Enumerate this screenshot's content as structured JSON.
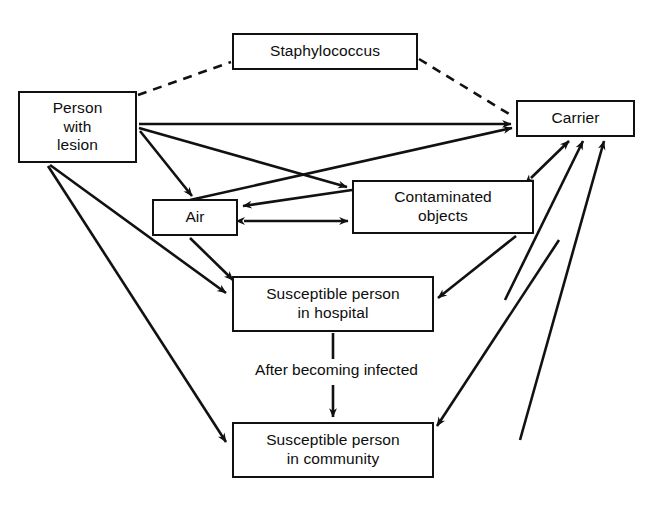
{
  "diagram": {
    "type": "flow-diagram",
    "background_color": "#ffffff",
    "line_color": "#111111",
    "text_color": "#0d0d0d",
    "nodes": [
      {
        "id": "staphylococcus",
        "label": "Staphylococcus"
      },
      {
        "id": "person_with_lesion",
        "label": "Person\nwith\nlesion"
      },
      {
        "id": "carrier",
        "label": "Carrier"
      },
      {
        "id": "air",
        "label": "Air"
      },
      {
        "id": "contaminated_objects",
        "label": "Contaminated\nobjects"
      },
      {
        "id": "susceptible_hospital",
        "label": "Susceptible person\nin hospital"
      },
      {
        "id": "susceptible_community",
        "label": "Susceptible person\nin community"
      }
    ],
    "edge_labels": [
      {
        "id": "after_becoming_infected",
        "text": "After becoming infected"
      }
    ],
    "edges": [
      {
        "from": "person_with_lesion",
        "to": "staphylococcus",
        "style": "dashed",
        "arrow": "none"
      },
      {
        "from": "staphylococcus",
        "to": "carrier",
        "style": "dashed",
        "arrow": "none"
      },
      {
        "from": "person_with_lesion",
        "to": "carrier",
        "style": "solid",
        "arrow": "to"
      },
      {
        "from": "person_with_lesion",
        "to": "contaminated_objects",
        "style": "solid",
        "arrow": "to"
      },
      {
        "from": "person_with_lesion",
        "to": "air",
        "style": "solid",
        "arrow": "to"
      },
      {
        "from": "person_with_lesion",
        "to": "susceptible_hospital",
        "style": "solid",
        "arrow": "to"
      },
      {
        "from": "person_with_lesion",
        "to": "susceptible_community",
        "style": "solid",
        "arrow": "to"
      },
      {
        "from": "air",
        "to": "carrier",
        "style": "solid",
        "arrow": "to"
      },
      {
        "from": "contaminated_objects",
        "to": "air",
        "style": "solid",
        "arrow": "to"
      },
      {
        "from": "air",
        "to": "contaminated_objects",
        "style": "solid",
        "arrow": "both"
      },
      {
        "from": "air",
        "to": "susceptible_hospital",
        "style": "solid",
        "arrow": "to"
      },
      {
        "from": "carrier",
        "to": "contaminated_objects",
        "style": "solid",
        "arrow": "both"
      },
      {
        "from": "contaminated_objects",
        "to": "susceptible_hospital",
        "style": "solid",
        "arrow": "to"
      },
      {
        "from": "susceptible_hospital",
        "to": "carrier",
        "style": "solid",
        "arrow": "to"
      },
      {
        "from": "susceptible_community",
        "to": "carrier",
        "style": "solid",
        "arrow": "to"
      },
      {
        "from": "carrier",
        "to": "susceptible_community",
        "style": "solid",
        "arrow": "to"
      },
      {
        "from": "susceptible_hospital",
        "to": "susceptible_community",
        "style": "solid",
        "arrow": "to",
        "label": "After becoming infected"
      }
    ]
  }
}
